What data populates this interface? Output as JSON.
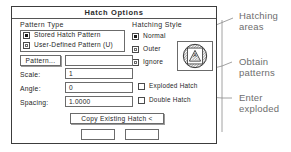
{
  "dialog": {
    "title": "Hatch Options",
    "pattern_type": {
      "group_label": "Pattern Type",
      "options": [
        {
          "label": "Stored Hatch Pattern",
          "selected": true
        },
        {
          "label": "User-Defined Pattern (U)",
          "selected": false
        }
      ]
    },
    "hatching_style": {
      "group_label": "Hatching Style",
      "options": [
        {
          "label": "Normal",
          "selected": true
        },
        {
          "label": "Outer",
          "selected": false
        },
        {
          "label": "Ignore",
          "selected": false
        }
      ]
    },
    "pattern_button": "Pattern...",
    "pattern_value": "",
    "fields": [
      {
        "label": "Scale:",
        "value": "1"
      },
      {
        "label": "Angle:",
        "value": "0"
      },
      {
        "label": "Spacing:",
        "value": "1.0000"
      }
    ],
    "checkboxes": [
      {
        "label": "Exploded Hatch",
        "checked": false
      },
      {
        "label": "Double Hatch",
        "checked": false
      }
    ],
    "copy_button": "Copy Existing Hatch <",
    "bottom_buttons": [
      {
        "label": ""
      },
      {
        "label": ""
      }
    ]
  },
  "annotations": [
    {
      "line1": "Hatching",
      "line2": "areas"
    },
    {
      "line1": "Obtain",
      "line2": "patterns"
    },
    {
      "line1": "Enter",
      "line2": "exploded"
    }
  ],
  "colors": {
    "ink": "#1a1a1a",
    "border": "#6b6b6b",
    "dialog_border": "#3c3c3c",
    "annotation": "#6e6e6e",
    "preview_fill": "#7d7d7d"
  }
}
